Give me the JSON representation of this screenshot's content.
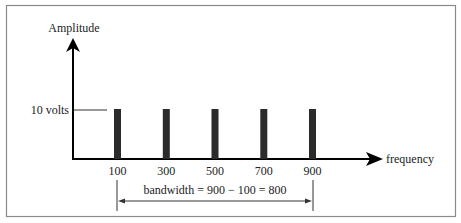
{
  "chart_data": {
    "type": "bar",
    "title": "",
    "xlabel": "frequency",
    "ylabel": "Amplitude",
    "categories": [
      "100",
      "300",
      "500",
      "700",
      "900"
    ],
    "x": [
      100,
      300,
      500,
      700,
      900
    ],
    "values": [
      10,
      10,
      10,
      10,
      10
    ],
    "units": "volts",
    "y_reference_label": "10 volts",
    "xlim": [
      0,
      1200
    ],
    "ylim": [
      0,
      25
    ],
    "grid": false,
    "legend": null,
    "annotations": [
      {
        "type": "double-arrow",
        "from": 100,
        "to": 900,
        "text": "bandwidth = 900 − 100 = 800"
      }
    ]
  },
  "labels": {
    "y_axis": "Amplitude",
    "x_axis": "frequency",
    "ref_level": "10 volts",
    "bandwidth": "bandwidth = 900 − 100 = 800"
  },
  "colors": {
    "bar": "#2b2b2b",
    "axis": "#000000",
    "frame": "#8a8a8a",
    "text": "#222222"
  }
}
